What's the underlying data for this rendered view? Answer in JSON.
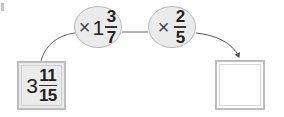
{
  "diagram": {
    "start": {
      "whole": "3",
      "numerator": "11",
      "denominator": "15"
    },
    "operations": [
      {
        "operator": "×",
        "whole": "1",
        "numerator": "3",
        "denominator": "7"
      },
      {
        "operator": "×",
        "whole": "",
        "numerator": "2",
        "denominator": "5"
      }
    ],
    "answer": {
      "value": ""
    }
  },
  "colors": {
    "node_fill": "#ebebeb",
    "node_border": "#b9b9b9",
    "line": "#666666"
  }
}
